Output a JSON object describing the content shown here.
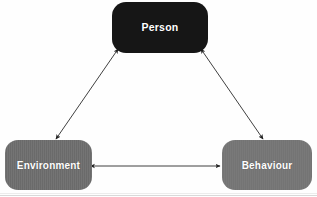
{
  "diagram": {
    "type": "triadic-reciprocal-determinism",
    "background_color": "#fefefe",
    "nodes": [
      {
        "id": "person",
        "label": "Person",
        "fill_color": "#161616",
        "text_color": "#ffffff",
        "x": 112,
        "y": 2,
        "width": 96,
        "height": 51
      },
      {
        "id": "environment",
        "label": "Environment",
        "fill_color": "#6e6e6e",
        "text_color": "#ffffff",
        "x": 5,
        "y": 140,
        "width": 87,
        "height": 50
      },
      {
        "id": "behaviour",
        "label": "Behaviour",
        "fill_color": "#767676",
        "text_color": "#ffffff",
        "x": 222,
        "y": 140,
        "width": 90,
        "height": 50
      }
    ],
    "connectors": [
      {
        "id": "person-environment",
        "from": "person",
        "to": "environment",
        "style": "double-headed-arrow",
        "color": "#2a2a2a",
        "x1": 116,
        "y1": 52,
        "x2": 56,
        "y2": 139
      },
      {
        "id": "person-behaviour",
        "from": "person",
        "to": "behaviour",
        "style": "double-headed-arrow",
        "color": "#2a2a2a",
        "x1": 203,
        "y1": 52,
        "x2": 263,
        "y2": 139
      },
      {
        "id": "environment-behaviour",
        "from": "environment",
        "to": "behaviour",
        "style": "double-headed-arrow",
        "color": "#2a2a2a",
        "x1": 93,
        "y1": 166,
        "x2": 221,
        "y2": 166
      }
    ]
  }
}
